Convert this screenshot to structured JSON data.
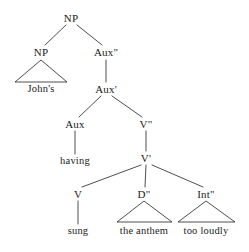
{
  "diagram": {
    "type": "syntax-tree",
    "title": "",
    "colors": {
      "ink": "#1b1b1b",
      "line": "#3a3a3a",
      "background": "#ffffff"
    },
    "nodes": [
      {
        "id": "np-root",
        "label": "NP",
        "x": 71,
        "y": 18
      },
      {
        "id": "np-subj",
        "label": "NP",
        "x": 41,
        "y": 52
      },
      {
        "id": "aux2",
        "label": "Aux\"",
        "x": 106,
        "y": 52
      },
      {
        "id": "aux1",
        "label": "Aux'",
        "x": 106,
        "y": 89
      },
      {
        "id": "aux0",
        "label": "Aux",
        "x": 75,
        "y": 124
      },
      {
        "id": "v2",
        "label": "V\"",
        "x": 146,
        "y": 124
      },
      {
        "id": "v1",
        "label": "V'",
        "x": 146,
        "y": 158
      },
      {
        "id": "v0",
        "label": "V",
        "x": 78,
        "y": 194
      },
      {
        "id": "d2",
        "label": "D\"",
        "x": 144,
        "y": 194
      },
      {
        "id": "int2",
        "label": "Int\"",
        "x": 206,
        "y": 194
      }
    ],
    "leaves": [
      {
        "id": "leaf-johns",
        "label": "John's",
        "x": 41,
        "y": 89
      },
      {
        "id": "leaf-having",
        "label": "having",
        "x": 75,
        "y": 161
      },
      {
        "id": "leaf-sung",
        "label": "sung",
        "x": 78,
        "y": 231
      },
      {
        "id": "leaf-the-anthem",
        "label": "the anthem",
        "x": 144,
        "y": 231
      },
      {
        "id": "leaf-too-loudly",
        "label": "too loudly",
        "x": 206,
        "y": 231
      }
    ],
    "edges": [
      {
        "id": "edge-np-root-np-subj",
        "x1": 66,
        "y1": 25,
        "x2": 45,
        "y2": 45
      },
      {
        "id": "edge-np-root-aux2",
        "x1": 77,
        "y1": 25,
        "x2": 102,
        "y2": 45
      },
      {
        "id": "edge-aux2-aux1",
        "x1": 106,
        "y1": 60,
        "x2": 106,
        "y2": 82
      },
      {
        "id": "edge-aux1-aux0",
        "x1": 101,
        "y1": 96,
        "x2": 79,
        "y2": 117
      },
      {
        "id": "edge-aux1-v2",
        "x1": 112,
        "y1": 96,
        "x2": 142,
        "y2": 117
      },
      {
        "id": "edge-aux0-having",
        "x1": 75,
        "y1": 131,
        "x2": 75,
        "y2": 154
      },
      {
        "id": "edge-v2-v1",
        "x1": 146,
        "y1": 131,
        "x2": 146,
        "y2": 151
      },
      {
        "id": "edge-v1-v0",
        "x1": 141,
        "y1": 165,
        "x2": 82,
        "y2": 187
      },
      {
        "id": "edge-v1-d2",
        "x1": 146,
        "y1": 165,
        "x2": 145,
        "y2": 187
      },
      {
        "id": "edge-v1-int2",
        "x1": 152,
        "y1": 165,
        "x2": 203,
        "y2": 187
      },
      {
        "id": "edge-v0-sung",
        "x1": 78,
        "y1": 201,
        "x2": 78,
        "y2": 224
      }
    ],
    "triangles": [
      {
        "id": "triangle-johns",
        "apex_x": 41,
        "apex_y": 60,
        "left_x": 15,
        "right_x": 67,
        "base_y": 82
      },
      {
        "id": "triangle-the-anthem",
        "apex_x": 144,
        "apex_y": 201,
        "left_x": 117,
        "right_x": 172,
        "base_y": 222
      },
      {
        "id": "triangle-too-loudly",
        "apex_x": 206,
        "apex_y": 201,
        "left_x": 178,
        "right_x": 235,
        "base_y": 222
      }
    ]
  }
}
